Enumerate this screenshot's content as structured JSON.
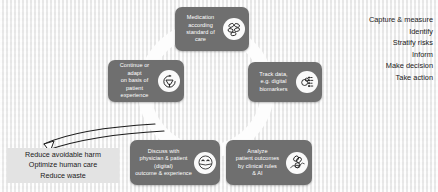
{
  "slide": {
    "background_color": "#f1f1f1",
    "ring_color": "#fdfdfd",
    "node_color": "#6f6f6f",
    "node_text_color": "#ffffff",
    "highlight_color": "#e3e3e3"
  },
  "cycle": {
    "nodes": [
      {
        "id": "medication",
        "label": "Medication\naccording\nstandard of\ncare",
        "icon": "pills-icon"
      },
      {
        "id": "track-data",
        "label": "Track data,\ne.g. digital\nbiomarkers",
        "icon": "data-tracking-icon"
      },
      {
        "id": "analyze",
        "label": "Analyze\npatient outcomes\nby clinical rules\n& AI",
        "icon": "analytics-icon"
      },
      {
        "id": "discuss",
        "label": "Discuss with\nphysician & patient\n(digital)\noutcome & experience",
        "icon": "patient-face-icon"
      },
      {
        "id": "continue-adapt",
        "label": "Continue or\nadapt\non basis of\npatient experience",
        "icon": "refresh-cycle-icon"
      }
    ]
  },
  "right_list": {
    "items": [
      "Capture & measure",
      "Identify",
      "Stratify risks",
      "Inform",
      "Make decision",
      "Take action"
    ]
  },
  "left_list": {
    "items": [
      "Reduce avoidable harm",
      "Optimize human care",
      "Reduce waste"
    ]
  }
}
